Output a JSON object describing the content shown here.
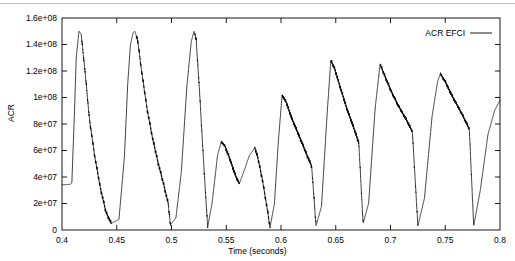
{
  "figure": {
    "background": "#ffffff",
    "line_color": "#000000",
    "axis_color": "#000000",
    "top_rule_color": "#bfbfbf"
  },
  "axes": {
    "x": {
      "label": "Time (seconds)",
      "min": 0.4,
      "max": 0.8,
      "ticks": [
        0.4,
        0.45,
        0.5,
        0.55,
        0.6,
        0.65,
        0.7,
        0.75,
        0.8
      ],
      "tick_labels": [
        "0.4",
        "0.45",
        "0.5",
        "0.55",
        "0.6",
        "0.65",
        "0.7",
        "0.75",
        "0.8"
      ]
    },
    "y": {
      "label": "ACR",
      "min": 0,
      "max": 160000000,
      "ticks": [
        0,
        20000000,
        40000000,
        60000000,
        80000000,
        100000000,
        120000000,
        140000000,
        160000000
      ],
      "tick_labels": [
        "0",
        "2e+07",
        "4e+07",
        "6e+07",
        "8e+07",
        "1e+08",
        "1.2e+08",
        "1.4e+08",
        "1.6e+08"
      ]
    }
  },
  "legend": {
    "position": "top-right",
    "entries": [
      {
        "label": "ACR EFCI",
        "color": "#000000",
        "style": "line"
      }
    ]
  },
  "chart_data": {
    "type": "line",
    "title": "",
    "xlabel": "Time (seconds)",
    "ylabel": "ACR",
    "xlim": [
      0.4,
      0.8
    ],
    "ylim": [
      0,
      160000000
    ],
    "grid": false,
    "legend_position": "top-right",
    "series": [
      {
        "name": "ACR EFCI",
        "color": "#000000",
        "description": "Sawtooth-like ACR (allowed cell rate) oscillation under EFCI congestion control; sharp rise to a peak followed by decay with noisy oscillatory band on the falling edge, repeating roughly every 0.05 s.",
        "peaks": [
          {
            "x": 0.4155,
            "y": 150000000
          },
          {
            "x": 0.4665,
            "y": 150000000
          },
          {
            "x": 0.5205,
            "y": 150000000
          },
          {
            "x": 0.5455,
            "y": 67000000
          },
          {
            "x": 0.576,
            "y": 62000000
          },
          {
            "x": 0.601,
            "y": 102000000
          },
          {
            "x": 0.6455,
            "y": 128000000
          },
          {
            "x": 0.6905,
            "y": 125000000
          },
          {
            "x": 0.7455,
            "y": 118000000
          },
          {
            "x": 0.8,
            "y": 98000000
          }
        ],
        "troughs": [
          {
            "x": 0.4,
            "y": 34000000
          },
          {
            "x": 0.445,
            "y": 5000000
          },
          {
            "x": 0.499,
            "y": 4000000
          },
          {
            "x": 0.533,
            "y": 2000000
          },
          {
            "x": 0.562,
            "y": 35000000
          },
          {
            "x": 0.59,
            "y": 2000000
          },
          {
            "x": 0.632,
            "y": 3000000
          },
          {
            "x": 0.675,
            "y": 5000000
          },
          {
            "x": 0.725,
            "y": 3000000
          },
          {
            "x": 0.776,
            "y": 3000000
          }
        ],
        "x": [
          0.4,
          0.4075,
          0.409,
          0.4115,
          0.413,
          0.4155,
          0.4175,
          0.421,
          0.425,
          0.43,
          0.435,
          0.44,
          0.445,
          0.452,
          0.457,
          0.46,
          0.4625,
          0.465,
          0.4665,
          0.469,
          0.473,
          0.478,
          0.483,
          0.488,
          0.493,
          0.497,
          0.499,
          0.504,
          0.509,
          0.514,
          0.518,
          0.5205,
          0.5225,
          0.5255,
          0.529,
          0.533,
          0.537,
          0.542,
          0.5455,
          0.549,
          0.554,
          0.559,
          0.562,
          0.566,
          0.571,
          0.576,
          0.579,
          0.583,
          0.587,
          0.59,
          0.594,
          0.5975,
          0.601,
          0.605,
          0.61,
          0.616,
          0.622,
          0.628,
          0.632,
          0.637,
          0.642,
          0.6455,
          0.649,
          0.654,
          0.66,
          0.666,
          0.671,
          0.675,
          0.68,
          0.686,
          0.6905,
          0.694,
          0.7,
          0.707,
          0.714,
          0.72,
          0.725,
          0.731,
          0.738,
          0.743,
          0.7455,
          0.75,
          0.757,
          0.765,
          0.772,
          0.776,
          0.782,
          0.789,
          0.795,
          0.8
        ],
        "y": [
          34000000,
          34500000,
          35500000,
          92000000,
          130000000,
          150000000,
          148000000,
          120000000,
          84000000,
          55000000,
          32000000,
          14000000,
          5000000,
          8000000,
          55000000,
          110000000,
          140000000,
          149000000,
          150000000,
          144000000,
          118000000,
          90000000,
          68000000,
          50000000,
          34000000,
          20000000,
          4000000,
          9000000,
          44000000,
          108000000,
          142000000,
          150000000,
          144000000,
          106000000,
          56000000,
          2000000,
          20000000,
          56000000,
          67000000,
          63000000,
          52000000,
          40000000,
          35000000,
          44000000,
          56000000,
          62000000,
          54000000,
          38000000,
          18000000,
          2000000,
          20000000,
          66000000,
          102000000,
          96000000,
          84000000,
          72000000,
          60000000,
          48000000,
          3000000,
          18000000,
          86000000,
          128000000,
          122000000,
          108000000,
          92000000,
          78000000,
          66000000,
          5000000,
          20000000,
          92000000,
          125000000,
          118000000,
          106000000,
          94000000,
          84000000,
          74000000,
          3000000,
          24000000,
          86000000,
          112000000,
          118000000,
          112000000,
          100000000,
          88000000,
          76000000,
          3000000,
          30000000,
          72000000,
          90000000,
          98000000
        ]
      }
    ]
  }
}
